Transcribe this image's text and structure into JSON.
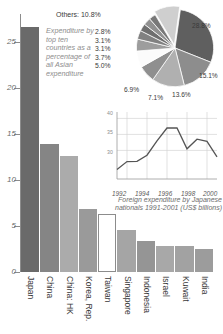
{
  "chart_data": [
    {
      "type": "bar",
      "title": "",
      "xlabel": "",
      "ylabel": "",
      "ylim": [
        0,
        28
      ],
      "yticks": [
        "0",
        "5",
        "10",
        "15",
        "20",
        "25"
      ],
      "ytick_values": [
        0,
        5,
        10,
        15,
        20,
        25
      ],
      "grid": false,
      "categories": [
        "Japan",
        "China",
        "China: HK",
        "Korea, Rep.",
        "Taiwan",
        "Singapore",
        "Indonesia",
        "Israel",
        "Kuwait",
        "India"
      ],
      "values": [
        26.6,
        13.9,
        12.6,
        6.8,
        6.3,
        4.6,
        3.4,
        2.8,
        2.8,
        2.5
      ],
      "bar_colors": [
        "#6a6a6a",
        "#858585",
        "#ababab",
        "#9a9a9a",
        "#ffffff",
        "#a5a5a5",
        "#959595",
        "#a8a8a8",
        "#a2a2a2",
        "#9c9c9c"
      ]
    },
    {
      "type": "pie",
      "title": "",
      "caption": "Expenditure by top ten countries as a percentage of all Asian expenditure",
      "others_label": "Others: 10.8%",
      "labels": [
        "28.8%",
        "15.1%",
        "13.6%",
        "7.1%",
        "6.9%",
        "5.0%",
        "3.7%",
        "3.1%",
        "3.1%",
        "2.8%",
        "10.8%"
      ],
      "values": [
        28.8,
        15.1,
        13.6,
        7.1,
        6.9,
        5.0,
        3.7,
        3.1,
        3.1,
        2.8,
        10.8
      ],
      "slice_colors": [
        "#5f5f5f",
        "#8d8d8d",
        "#b0b0b0",
        "#8f8f8f",
        "#fbfbfb",
        "#9d9d9d",
        "#818181",
        "#6e6e6e",
        "#909090",
        "#787878",
        "#cfcfcf"
      ],
      "side_labels": [
        "2.8%",
        "3.1%",
        "3.1%",
        "3.7%",
        "5.0%"
      ],
      "edge_labels": {
        "p288": "28.8%",
        "p151": "15.1%",
        "p136": "13.6%",
        "p71": "7.1%",
        "p69": "6.9%"
      }
    },
    {
      "type": "line",
      "title": "",
      "caption": "Foreign expenditure by Japanese nationals 1991-2001 (US$ billions)",
      "xlabel": "",
      "ylabel": "",
      "ylim": [
        22,
        42
      ],
      "yticks": [
        "40",
        "35",
        "30"
      ],
      "xticks": [
        "1992",
        "1994",
        "1996",
        "1998",
        "2000"
      ],
      "x": [
        1991,
        1992,
        1993,
        1994,
        1995,
        1996,
        1997,
        1998,
        1999,
        2000,
        2001
      ],
      "values": [
        24.0,
        26.5,
        26.6,
        28.5,
        33.0,
        37.0,
        37.0,
        30.5,
        33.5,
        32.8,
        28.0
      ],
      "grid": true,
      "line_color": "#555555"
    }
  ]
}
